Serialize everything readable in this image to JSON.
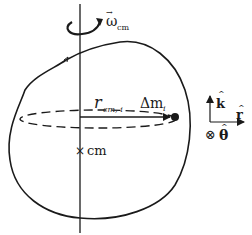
{
  "diagram": {
    "labels": {
      "omega_main": "ω",
      "omega_sub": "cm",
      "omega_vec": "→",
      "r_main": "r",
      "r_sub": "cm, i",
      "mass_delta": "Δm",
      "mass_sub": "i",
      "cm_marker": "×",
      "cm_label": "cm",
      "k_hat": "k",
      "r_hat": "r",
      "theta_into": "⊗",
      "theta_hat": "θ",
      "hat": "^"
    },
    "colors": {
      "ink": "#1a1a1a",
      "background": "#ffffff"
    }
  }
}
